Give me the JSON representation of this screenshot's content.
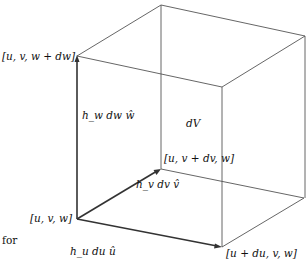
{
  "diagram": {
    "type": "volume-element-cube",
    "labels": {
      "origin": "[u, v, w]",
      "top_left": "[u, v, w + dw]",
      "back": "[u, v + dv, w]",
      "front_right": "[u + du, v, w]",
      "volume": "dV",
      "w_vector": "h_w dw ŵ",
      "v_vector": "h_v dv v̂",
      "u_vector": "h_u du û",
      "prefix": "for"
    },
    "vertices": {
      "origin": [
        77,
        219
      ],
      "top_left": [
        77,
        56
      ],
      "back_bottom": [
        161,
        169
      ],
      "back_top": [
        161,
        5
      ],
      "front_bottom_right": [
        222,
        247
      ],
      "front_top_right": [
        222,
        87
      ],
      "far_bottom_right": [
        304,
        198
      ],
      "far_top_right": [
        305,
        36
      ]
    },
    "colors": {
      "edge": "#555555",
      "arrow": "#333333",
      "text": "#111111"
    }
  }
}
